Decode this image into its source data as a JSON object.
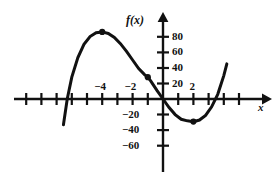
{
  "figure": {
    "kind": "cartesian-graph",
    "background": "#ffffff",
    "ink": "#111111"
  },
  "axes": {
    "y_axis_name": "f(x)",
    "x_axis_name": "x",
    "y_tick_labels": [
      "80",
      "60",
      "40",
      "20",
      "-20",
      "-40",
      "-60"
    ],
    "x_tick_labels": [
      "-4",
      "-2",
      "2"
    ]
  },
  "chart_data": {
    "type": "line",
    "title": "",
    "xlabel": "x",
    "ylabel": "f(x)",
    "xlim": [
      -7.6,
      5.2
    ],
    "ylim": [
      -75,
      95
    ],
    "grid": false,
    "legend": null,
    "x_ticks": [
      -7,
      -6,
      -5,
      -4,
      -3,
      -2,
      -1,
      1,
      2,
      3,
      4
    ],
    "x_tick_labels_shown": {
      "-4": "-4",
      "-2": "-2",
      "2": "2"
    },
    "y_ticks": [
      80,
      60,
      40,
      20,
      -20,
      -40,
      -60
    ],
    "y_tick_labels_shown": {
      "80": "80",
      "60": "60",
      "40": "40",
      "20": "20",
      "-20": "-20",
      "-40": "-40",
      "-60": "-60"
    },
    "series": [
      {
        "name": "f",
        "x": [
          -6.55,
          -6.3,
          -6.0,
          -5.6,
          -5.2,
          -4.8,
          -4.4,
          -4.0,
          -3.6,
          -3.2,
          -2.8,
          -2.4,
          -2.0,
          -1.6,
          -1.2,
          -1.0,
          -0.8,
          -0.4,
          0.0,
          0.4,
          0.8,
          1.2,
          1.6,
          2.0,
          2.4,
          2.8,
          3.2,
          3.6,
          4.0,
          4.2
        ],
        "y": [
          -33,
          0,
          28,
          53,
          70,
          80,
          85,
          86,
          84,
          79,
          71,
          61,
          50,
          39,
          31,
          28,
          23,
          11,
          0,
          -11,
          -20,
          -26,
          -28,
          -29,
          -27,
          -21,
          -10,
          6,
          30,
          45
        ]
      }
    ],
    "marked_points": [
      {
        "label": "local maximum",
        "x": -4.0,
        "y": 86
      },
      {
        "label": "inflection point",
        "x": -1.0,
        "y": 28
      },
      {
        "label": "local minimum",
        "x": 2.0,
        "y": -29
      }
    ],
    "x_intercepts": [
      -6.3,
      0.0,
      3.7
    ]
  }
}
